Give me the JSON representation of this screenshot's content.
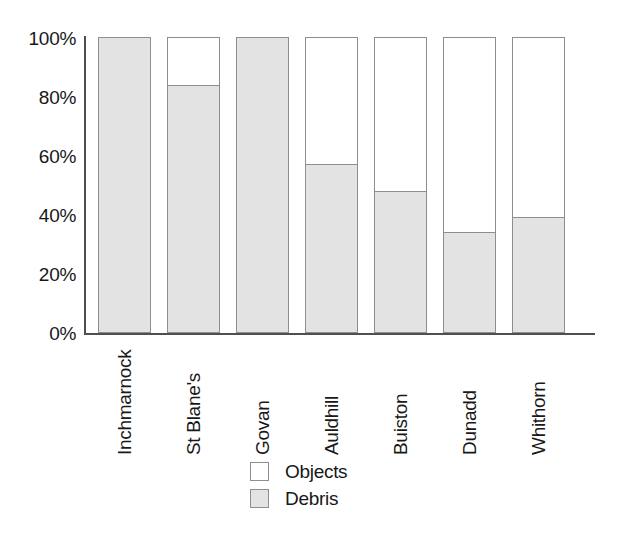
{
  "chart_data": {
    "type": "bar",
    "subtype": "stacked-percentage",
    "title": "",
    "subtitle": "",
    "xlabel": "",
    "ylabel": "",
    "ylim": [
      0,
      100
    ],
    "y_unit": "%",
    "grid": false,
    "legend_position": "bottom-center",
    "categories": [
      "Inchmarnock",
      "St Blane's",
      "Govan",
      "Auldhill",
      "Buiston",
      "Dunadd",
      "Whithorn"
    ],
    "y_ticks": [
      0,
      20,
      40,
      60,
      80,
      100
    ],
    "y_tick_labels": [
      "0%",
      "20%",
      "40%",
      "60%",
      "80%",
      "100%"
    ],
    "series": [
      {
        "name": "Objects",
        "color": "#ffffff",
        "values": [
          0,
          16,
          0,
          43,
          52,
          66,
          61
        ]
      },
      {
        "name": "Debris",
        "color": "#e3e3e3",
        "values": [
          100,
          84,
          100,
          57,
          48,
          34,
          39
        ]
      }
    ],
    "legend": [
      {
        "label": "Objects",
        "swatch": "#ffffff"
      },
      {
        "label": "Debris",
        "swatch": "#e3e3e3"
      }
    ],
    "colors": {
      "objects_fill": "#ffffff",
      "debris_fill": "#e3e3e3",
      "bar_border": "#8e8e8e",
      "axis": "#4f4f4f",
      "text": "#181818",
      "background": "#ffffff"
    }
  }
}
